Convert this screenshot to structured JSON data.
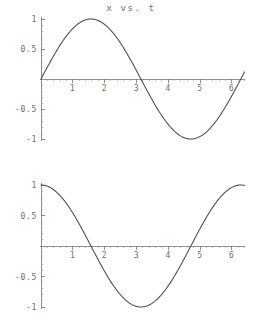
{
  "figure": {
    "background_color": "#ffffff",
    "curve_color": "#4a4a4a",
    "axis_color": "#737373",
    "label_color": "#6e6e6e"
  },
  "chart_data": [
    {
      "type": "line",
      "id": "x-vs-t",
      "title": "x vs. t",
      "xlabel": "",
      "ylabel": "",
      "xlim": [
        0,
        6.4
      ],
      "ylim": [
        -1,
        1
      ],
      "grid": false,
      "legend": "none",
      "axis_position": "zero-crossing",
      "x_ticks": [
        1,
        2,
        3,
        4,
        5,
        6
      ],
      "x_tick_labels": [
        "1",
        "2",
        "3",
        "4",
        "5",
        "6"
      ],
      "x_minor_tick_step": 0.2,
      "y_ticks": [
        1,
        0.5,
        -0.5,
        -1
      ],
      "y_tick_labels": [
        "1",
        "0.5",
        "-0.5",
        "-1"
      ],
      "y_minor_tick_step": 0.1,
      "series": [
        {
          "name": "x = sin(t)",
          "function": "sin",
          "amplitude": 1,
          "phase": 0,
          "x": [
            0,
            0.2,
            0.4,
            0.6,
            0.8,
            1.0,
            1.2,
            1.4,
            1.5708,
            1.8,
            2.0,
            2.2,
            2.4,
            2.6,
            2.8,
            3.0,
            3.1416,
            3.4,
            3.6,
            3.8,
            4.0,
            4.2,
            4.4,
            4.6,
            4.7124,
            5.0,
            5.2,
            5.4,
            5.6,
            5.8,
            6.0,
            6.2,
            6.2832,
            6.4
          ],
          "values": [
            0,
            0.199,
            0.389,
            0.565,
            0.717,
            0.841,
            0.932,
            0.985,
            1.0,
            0.974,
            0.909,
            0.808,
            0.675,
            0.516,
            0.335,
            0.141,
            0,
            -0.256,
            -0.443,
            -0.612,
            -0.757,
            -0.872,
            -0.952,
            -0.994,
            -1.0,
            -0.959,
            -0.883,
            -0.773,
            -0.631,
            -0.465,
            -0.279,
            -0.083,
            0,
            0.117
          ]
        }
      ]
    },
    {
      "type": "line",
      "id": "xprime-vs-t",
      "title": "x' vs. t",
      "xlabel": "",
      "ylabel": "",
      "xlim": [
        0,
        6.4
      ],
      "ylim": [
        -1,
        1
      ],
      "grid": false,
      "legend": "none",
      "axis_position": "zero-crossing",
      "x_ticks": [
        1,
        2,
        3,
        4,
        5,
        6
      ],
      "x_tick_labels": [
        "1",
        "2",
        "3",
        "4",
        "5",
        "6"
      ],
      "x_minor_tick_step": 0.2,
      "y_ticks": [
        1,
        0.5,
        -0.5,
        -1
      ],
      "y_tick_labels": [
        "1",
        "0.5",
        "-0.5",
        "-1"
      ],
      "y_minor_tick_step": 0.1,
      "series": [
        {
          "name": "x' = cos(t)",
          "function": "cos",
          "amplitude": 1,
          "phase": 1.5708,
          "x": [
            0,
            0.2,
            0.4,
            0.6,
            0.8,
            1.0,
            1.2,
            1.4,
            1.5708,
            1.8,
            2.0,
            2.2,
            2.4,
            2.6,
            2.8,
            3.0,
            3.1416,
            3.4,
            3.6,
            3.8,
            4.0,
            4.2,
            4.4,
            4.6,
            4.7124,
            5.0,
            5.2,
            5.4,
            5.6,
            5.8,
            6.0,
            6.2,
            6.2832,
            6.4
          ],
          "values": [
            1.0,
            0.98,
            0.921,
            0.825,
            0.697,
            0.54,
            0.362,
            0.17,
            0,
            -0.227,
            -0.416,
            -0.589,
            -0.737,
            -0.857,
            -0.942,
            -0.99,
            -1.0,
            -0.967,
            -0.897,
            -0.791,
            -0.654,
            -0.49,
            -0.307,
            -0.112,
            0,
            0.284,
            0.469,
            0.635,
            0.776,
            0.886,
            0.96,
            0.997,
            1.0,
            0.993
          ]
        }
      ]
    }
  ],
  "plots": {
    "top": {
      "title": "x vs. t",
      "y_labels": [
        "1",
        "0.5",
        "-0.5",
        "-1"
      ],
      "x_labels": [
        "1",
        "2",
        "3",
        "4",
        "5",
        "6"
      ]
    },
    "bottom": {
      "title": "x' vs. t",
      "y_labels": [
        "1",
        "0.5",
        "-0.5",
        "-1"
      ],
      "x_labels": [
        "1",
        "2",
        "3",
        "4",
        "5",
        "6"
      ]
    }
  }
}
